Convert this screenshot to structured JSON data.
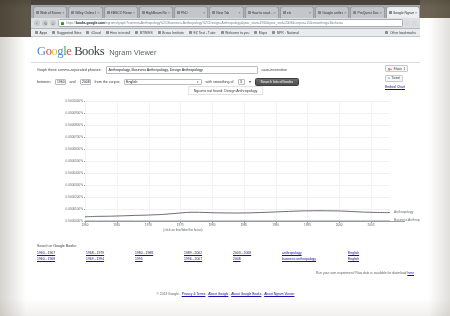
{
  "browser": {
    "tabs": [
      {
        "title": "Web of Science [v",
        "active": false
      },
      {
        "title": "Wiley Online Library",
        "active": false
      },
      {
        "title": "EBSCO Resource of",
        "active": false
      },
      {
        "title": "HighBeam Research",
        "active": false
      },
      {
        "title": "PhD",
        "active": false
      },
      {
        "title": "New Tab",
        "active": false
      },
      {
        "title": "How to read ...",
        "active": false
      },
      {
        "title": "etc",
        "active": false
      },
      {
        "title": "Google anthropol...",
        "active": false
      },
      {
        "title": "ProQuest Document",
        "active": false
      },
      {
        "title": "Google Ngram Viewer",
        "active": true
      }
    ],
    "nav": {
      "back": "‹",
      "forward": "›",
      "reload": "↻",
      "home": "⌂"
    },
    "url_prefix": "https://",
    "url_domain": "books.google.com",
    "url_path": "/ngrams/graph?content=Anthropology%2CBusiness+Anthropology%2CDesign+Anthropology&year_start=1960&year_end=2008&corpus=15&smoothing=3&share=",
    "omnibox_star": "☆",
    "bookmarks": [
      "Apps",
      "Suggested Sites",
      "iCloud",
      "How to install",
      "BTW/ES",
      "Brava Institute",
      "EZ Test - Tutor",
      "Welcome to you",
      "Maps",
      "NPR : National"
    ],
    "other_bookmarks": "Other bookmarks"
  },
  "header": {
    "logo_google": "Google",
    "logo_books": "Books",
    "subtitle": "Ngram Viewer"
  },
  "form": {
    "phrases_label": "Graph these comma-separated phrases:",
    "phrases_value": "Anthropology, Business Anthropology, Design Anthropology",
    "case_insensitive_label": "case-insensitive",
    "between_label": "between",
    "year_start": "1960",
    "and_label": "and",
    "year_end": "2008",
    "corpus_label": "from the corpus",
    "corpus_value": "English",
    "smoothing_label": "with smoothing of",
    "smoothing_value": "3",
    "search_button": "Search lots of books"
  },
  "share": {
    "google_plus_label": "Share",
    "google_plus_count": "1",
    "tweet_label": "Tweet",
    "embed_label": "Embed Chart"
  },
  "chart_title": "Ngrams not found: Design Anthropology",
  "chart_data": {
    "type": "line",
    "title": "Ngrams not found: Design Anthropology",
    "xlabel": "(click on line/label for focus)",
    "ylabel": "",
    "xlim": [
      1960,
      2008
    ],
    "ylim": [
      0,
      0.001
    ],
    "grid": true,
    "legend": "inline-right-labels",
    "xticks": [
      "1960",
      "1965",
      "1970",
      "1975",
      "1980",
      "1985",
      "1990",
      "1995",
      "2000",
      "2005"
    ],
    "yticks": [
      "0.0000000%",
      "0.0000100%",
      "0.0000200%",
      "0.0000300%",
      "0.0000400%",
      "0.0000500%",
      "0.0000600%",
      "0.0000700%",
      "0.0000800%",
      "0.0000900%",
      "0.0001000%"
    ],
    "series": [
      {
        "name": "Anthropology",
        "color": "#5b6066",
        "x": [
          1960,
          1962,
          1964,
          1966,
          1968,
          1970,
          1972,
          1974,
          1976,
          1978,
          1980,
          1982,
          1984,
          1986,
          1988,
          1990,
          1992,
          1994,
          1996,
          1998,
          2000,
          2002,
          2004,
          2006,
          2008
        ],
        "values": [
          3.5e-05,
          3.87e-05,
          4e-05,
          4.32e-05,
          4.68e-05,
          4.95e-05,
          5.4e-05,
          6.2e-05,
          7.15e-05,
          7.25e-05,
          6.9e-05,
          6.72e-05,
          6.65e-05,
          6.8e-05,
          7.12e-05,
          7.55e-05,
          8e-05,
          8.38e-05,
          8.55e-05,
          8.52e-05,
          8.38e-05,
          7.9e-05,
          7.38e-05,
          7.12e-05,
          7e-05
        ]
      },
      {
        "name": "Business Anthropology",
        "color": "#8d9298",
        "x": [
          1960,
          1970,
          1980,
          1990,
          2000,
          2008
        ],
        "values": [
          0.0,
          0.0,
          1e-07,
          2e-07,
          4e-07,
          6e-07
        ]
      }
    ]
  },
  "search_section": {
    "title": "Search in Google Books:",
    "columns": [
      {
        "links": [
          "1960 - 1967",
          "1960 - 1968"
        ]
      },
      {
        "links": [
          "1968 - 1979",
          "1969 - 1994"
        ]
      },
      {
        "links": [
          "1980 - 1988",
          "1995"
        ]
      },
      {
        "links": [
          "1989 - 2002",
          "1996 - 2007"
        ]
      },
      {
        "links": [
          "2003 - 2008",
          "2008"
        ]
      },
      {
        "links": [
          "anthropology",
          "business anthropology"
        ]
      },
      {
        "links": [
          "English",
          "English"
        ]
      }
    ],
    "note_text": "Run your own experiment! Raw data is available for download",
    "note_link": "here"
  },
  "footer": {
    "copyright": "© 2013 Google",
    "links": [
      "Privacy & Terms",
      "About Google",
      "About Google Books",
      "About Ngram Viewer"
    ]
  }
}
